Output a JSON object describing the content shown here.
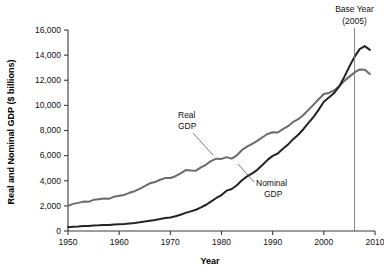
{
  "chart_data": {
    "type": "line",
    "title": "",
    "xlabel": "Year",
    "ylabel": "Real and Nominal GDP ($ billions)",
    "xlim": [
      1950,
      2010
    ],
    "ylim": [
      0,
      16000
    ],
    "grid": false,
    "legend_position": "inline-annotations",
    "xticks": [
      1950,
      1960,
      1970,
      1980,
      1990,
      2000,
      2010
    ],
    "xtick_labels": [
      "1950",
      "1960",
      "1970",
      "1980",
      "1990",
      "2000",
      "2010"
    ],
    "yticks": [
      0,
      2000,
      4000,
      6000,
      8000,
      10000,
      12000,
      14000,
      16000
    ],
    "ytick_labels": [
      "0",
      "2,000",
      "4,000",
      "6,000",
      "8,000",
      "10,000",
      "12,000",
      "14,000",
      "16,000"
    ],
    "x": [
      1950,
      1951,
      1952,
      1953,
      1954,
      1955,
      1956,
      1957,
      1958,
      1959,
      1960,
      1961,
      1962,
      1963,
      1964,
      1965,
      1966,
      1967,
      1968,
      1969,
      1970,
      1971,
      1972,
      1973,
      1974,
      1975,
      1976,
      1977,
      1978,
      1979,
      1980,
      1981,
      1982,
      1983,
      1984,
      1985,
      1986,
      1987,
      1988,
      1989,
      1990,
      1991,
      1992,
      1993,
      1994,
      1995,
      1996,
      1997,
      1998,
      1999,
      2000,
      2001,
      2002,
      2003,
      2004,
      2005,
      2006,
      2007,
      2008,
      2009
    ],
    "series": [
      {
        "name": "Real GDP",
        "color": "#6b6b6b",
        "values": [
          2000,
          2160,
          2240,
          2340,
          2320,
          2480,
          2530,
          2580,
          2560,
          2730,
          2800,
          2870,
          3040,
          3170,
          3350,
          3570,
          3800,
          3900,
          4080,
          4210,
          4220,
          4360,
          4590,
          4850,
          4820,
          4800,
          5060,
          5290,
          5580,
          5760,
          5740,
          5880,
          5760,
          6020,
          6450,
          6710,
          6940,
          7170,
          7460,
          7720,
          7860,
          7840,
          8110,
          8340,
          8680,
          8900,
          9230,
          9640,
          10060,
          10490,
          10900,
          10990,
          11190,
          11510,
          11950,
          12290,
          12620,
          12860,
          12840,
          12490
        ]
      },
      {
        "name": "Nominal GDP",
        "color": "#232323",
        "values": [
          300,
          340,
          360,
          390,
          390,
          430,
          450,
          480,
          480,
          520,
          540,
          560,
          600,
          640,
          690,
          750,
          820,
          870,
          950,
          1040,
          1080,
          1170,
          1290,
          1440,
          1560,
          1690,
          1880,
          2090,
          2360,
          2630,
          2860,
          3210,
          3340,
          3640,
          4040,
          4350,
          4590,
          4870,
          5250,
          5660,
          5980,
          6170,
          6540,
          6880,
          7310,
          7660,
          8100,
          8610,
          9090,
          9660,
          10290,
          10620,
          10980,
          11510,
          12270,
          13090,
          13860,
          14480,
          14720,
          14420
        ]
      }
    ],
    "annotations": [
      {
        "id": "base-year",
        "text_line1": "Base Year",
        "text_line2": "(2005)",
        "at_x": 2006,
        "type": "vertical-marker"
      },
      {
        "id": "real-gdp-label",
        "text_line1": "Real",
        "text_line2": "GDP",
        "points_to_x": 1983
      },
      {
        "id": "nominal-gdp-label",
        "text_line1": "Nominal",
        "text_line2": "GDP",
        "points_to_x": 1989
      }
    ]
  }
}
